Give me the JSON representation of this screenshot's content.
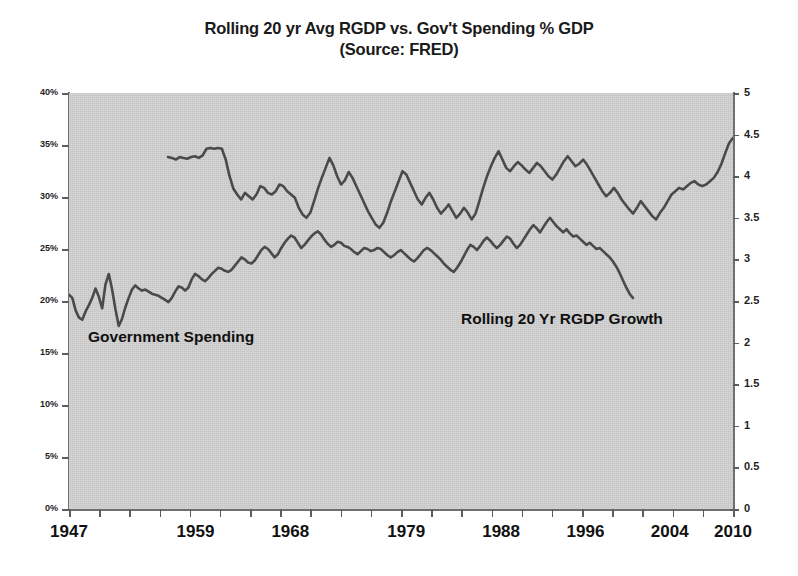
{
  "title": {
    "line1": "Rolling 20 yr Avg RGDP vs. Gov't Spending % GDP",
    "line2": "(Source: FRED)"
  },
  "annotations": {
    "gov_spending": "Government Spending",
    "rgdp_growth": "Rolling 20 Yr RGDP Growth"
  },
  "colors": {
    "plot_background": "#c4c4c4",
    "line": "#4a4a4a",
    "axis": "#6f6f6f",
    "text": "#111111"
  },
  "chart_data": {
    "type": "line",
    "title": "Rolling 20 yr Avg RGDP vs. Gov't Spending % GDP (Source: FRED)",
    "subtitle": "(Source: FRED)",
    "xlabel": "",
    "ylabel": "",
    "grid": false,
    "legend": "inline-annotations",
    "xlim": [
      1947,
      2010
    ],
    "x_tick_labels": [
      "1947",
      "1959",
      "1968",
      "1979",
      "1988",
      "1996",
      "2004",
      "2010"
    ],
    "x_tick_values": [
      1947,
      1959,
      1968,
      1979,
      1988,
      1996,
      2004,
      2010
    ],
    "axes": [
      {
        "id": "left",
        "label": "Government Spending % GDP",
        "ylim": [
          0,
          40
        ],
        "tick_step": 5,
        "tick_labels": [
          "0%",
          "5%",
          "10%",
          "15%",
          "20%",
          "25%",
          "30%",
          "35%",
          "40%"
        ],
        "tick_values": [
          0,
          5,
          10,
          15,
          20,
          25,
          30,
          35,
          40
        ]
      },
      {
        "id": "right",
        "label": "Rolling 20 Yr RGDP Growth %",
        "ylim": [
          0,
          5
        ],
        "tick_step": 0.5,
        "tick_labels": [
          "0",
          "0.5",
          "1",
          "1.5",
          "2",
          "2.5",
          "3",
          "3.5",
          "4",
          "4.5",
          "5"
        ],
        "tick_values": [
          0,
          0.5,
          1,
          1.5,
          2,
          2.5,
          3,
          3.5,
          4,
          4.5,
          5
        ]
      }
    ],
    "series": [
      {
        "name": "Government Spending",
        "axis": "left",
        "unit": "% of GDP",
        "x_start": 1947,
        "x_end": 2000.5,
        "values": [
          20.6,
          20.3,
          19.1,
          18.4,
          18.2,
          19.0,
          19.6,
          20.3,
          21.2,
          20.4,
          19.3,
          21.6,
          22.6,
          21.1,
          19.2,
          17.6,
          18.3,
          19.4,
          20.3,
          21.1,
          21.5,
          21.2,
          21.0,
          21.1,
          20.9,
          20.7,
          20.6,
          20.5,
          20.3,
          20.1,
          19.9,
          20.3,
          20.9,
          21.4,
          21.3,
          21.0,
          21.3,
          22.1,
          22.6,
          22.4,
          22.1,
          21.9,
          22.2,
          22.6,
          22.9,
          23.2,
          23.1,
          22.9,
          22.8,
          23.0,
          23.4,
          23.8,
          24.2,
          24.0,
          23.7,
          23.6,
          23.9,
          24.4,
          24.9,
          25.2,
          25.0,
          24.6,
          24.2,
          24.5,
          25.1,
          25.6,
          26.0,
          26.3,
          26.1,
          25.6,
          25.1,
          25.4,
          25.8,
          26.2,
          26.5,
          26.7,
          26.4,
          25.9,
          25.5,
          25.2,
          25.4,
          25.7,
          25.6,
          25.3,
          25.2,
          25.0,
          24.7,
          24.5,
          24.8,
          25.1,
          25.0,
          24.8,
          24.9,
          25.1,
          25.0,
          24.7,
          24.4,
          24.2,
          24.4,
          24.7,
          24.9,
          24.6,
          24.3,
          24.0,
          23.8,
          24.1,
          24.5,
          24.9,
          25.1,
          24.9,
          24.6,
          24.3,
          24.0,
          23.6,
          23.3,
          23.0,
          22.8,
          23.2,
          23.7,
          24.3,
          24.9,
          25.4,
          25.2,
          24.9,
          25.3,
          25.8,
          26.1,
          25.8,
          25.4,
          25.1,
          25.4,
          25.8,
          26.2,
          26.0,
          25.5,
          25.1,
          25.4,
          25.9,
          26.4,
          26.9,
          27.3,
          27.0,
          26.6,
          27.1,
          27.6,
          28.0,
          27.6,
          27.2,
          26.9,
          26.6,
          26.9,
          26.5,
          26.2,
          26.3,
          26.0,
          25.7,
          25.4,
          25.6,
          25.3,
          25.0,
          25.1,
          24.8,
          24.5,
          24.2,
          23.8,
          23.3,
          22.7,
          22.0,
          21.3,
          20.7,
          20.3
        ]
      },
      {
        "name": "Rolling 20 Yr RGDP Growth",
        "axis": "right",
        "unit": "%",
        "x_start": 1956.4,
        "x_end": 2010,
        "values": [
          4.23,
          4.22,
          4.2,
          4.23,
          4.22,
          4.21,
          4.23,
          4.24,
          4.22,
          4.25,
          4.33,
          4.34,
          4.33,
          4.34,
          4.33,
          4.2,
          4.0,
          3.85,
          3.78,
          3.72,
          3.8,
          3.76,
          3.72,
          3.78,
          3.88,
          3.86,
          3.8,
          3.78,
          3.82,
          3.9,
          3.88,
          3.82,
          3.78,
          3.74,
          3.62,
          3.54,
          3.5,
          3.56,
          3.7,
          3.85,
          3.98,
          4.1,
          4.22,
          4.13,
          4.0,
          3.9,
          3.95,
          4.05,
          3.98,
          3.88,
          3.78,
          3.68,
          3.58,
          3.5,
          3.42,
          3.38,
          3.44,
          3.56,
          3.7,
          3.82,
          3.94,
          4.06,
          4.02,
          3.92,
          3.82,
          3.72,
          3.66,
          3.74,
          3.8,
          3.72,
          3.62,
          3.55,
          3.6,
          3.66,
          3.58,
          3.5,
          3.55,
          3.62,
          3.56,
          3.48,
          3.55,
          3.7,
          3.86,
          4.0,
          4.12,
          4.22,
          4.3,
          4.2,
          4.1,
          4.06,
          4.12,
          4.17,
          4.13,
          4.08,
          4.04,
          4.1,
          4.16,
          4.12,
          4.06,
          4.0,
          3.96,
          4.02,
          4.1,
          4.18,
          4.24,
          4.18,
          4.12,
          4.15,
          4.2,
          4.14,
          4.06,
          3.98,
          3.9,
          3.82,
          3.76,
          3.8,
          3.86,
          3.8,
          3.72,
          3.66,
          3.6,
          3.55,
          3.62,
          3.7,
          3.64,
          3.58,
          3.52,
          3.48,
          3.56,
          3.62,
          3.7,
          3.78,
          3.82,
          3.86,
          3.84,
          3.88,
          3.92,
          3.94,
          3.9,
          3.88,
          3.9,
          3.94,
          3.98,
          4.05,
          4.15,
          4.28,
          4.4,
          4.46
        ]
      }
    ]
  }
}
